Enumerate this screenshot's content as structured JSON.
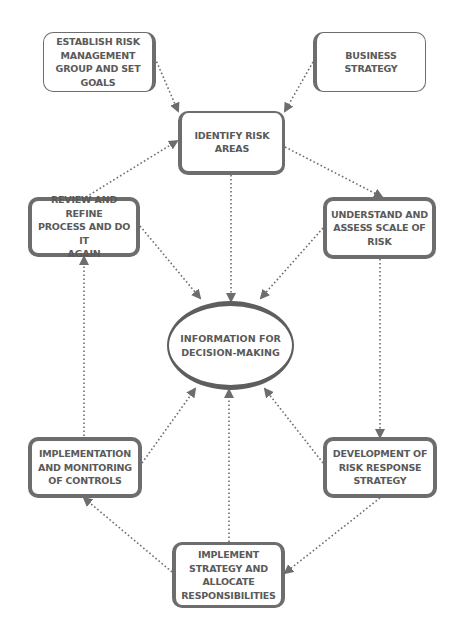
{
  "diagram": {
    "center": {
      "label": "INFORMATION FOR\nDECISION-MAKING"
    },
    "nodes": [
      {
        "id": "establish",
        "label": "ESTABLISH RISK\nMANAGEMENT\nGROUP AND SET\nGOALS"
      },
      {
        "id": "business",
        "label": "BUSINESS\nSTRATEGY"
      },
      {
        "id": "identify",
        "label": "IDENTIFY RISK\nAREAS"
      },
      {
        "id": "review",
        "label": "REVIEW AND REFINE\nPROCESS AND DO IT\nAGAIN"
      },
      {
        "id": "understand",
        "label": "UNDERSTAND AND\nASSESS SCALE OF\nRISK"
      },
      {
        "id": "implementation",
        "label": "IMPLEMENTATION\nAND MONITORING\nOF CONTROLS"
      },
      {
        "id": "development",
        "label": "DEVELOPMENT OF\nRISK RESPONSE\nSTRATEGY"
      },
      {
        "id": "implement",
        "label": "IMPLEMENT\nSTRATEGY AND\nALLOCATE\nRESPONSIBILITIES"
      }
    ],
    "edges": [
      {
        "from": "establish",
        "to": "identify"
      },
      {
        "from": "business",
        "to": "identify"
      },
      {
        "from": "identify",
        "to": "understand"
      },
      {
        "from": "identify",
        "to": "center"
      },
      {
        "from": "review",
        "to": "identify"
      },
      {
        "from": "review",
        "to": "center"
      },
      {
        "from": "understand",
        "to": "center"
      },
      {
        "from": "understand",
        "to": "development"
      },
      {
        "from": "development",
        "to": "center"
      },
      {
        "from": "development",
        "to": "implement"
      },
      {
        "from": "implement",
        "to": "center"
      },
      {
        "from": "implement",
        "to": "implementation"
      },
      {
        "from": "implementation",
        "to": "center"
      },
      {
        "from": "implementation",
        "to": "review"
      }
    ],
    "colors": {
      "stroke": "#6d6d6d",
      "text": "#5a5a5a",
      "background": "#ffffff"
    }
  }
}
